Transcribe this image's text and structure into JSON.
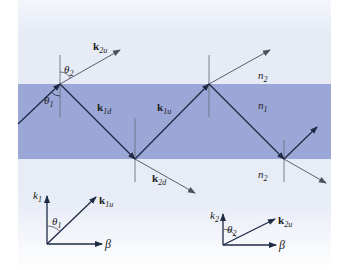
{
  "diagram": {
    "colors": {
      "cladding_top": "#e6ebf6",
      "cladding_bottom": "#ffffff",
      "core_band": "#9ba7d7",
      "ray": "#1f2a44",
      "transmitted_ray": "#4a4f5c",
      "normal_line": "#6e7280"
    },
    "regions": {
      "top_cladding_label": "n",
      "top_cladding_sub": "2",
      "core_label": "n",
      "core_sub": "1",
      "bottom_cladding_label": "n",
      "bottom_cladding_sub": "2"
    },
    "vectors": {
      "k2u": {
        "main": "k",
        "sub": "2u"
      },
      "k1d": {
        "main": "k",
        "sub": "1d"
      },
      "k1u": {
        "main": "k",
        "sub": "1u"
      },
      "k2d": {
        "main": "k",
        "sub": "2d"
      }
    },
    "angles": {
      "theta1": {
        "main": "θ",
        "sub": "1"
      },
      "theta2": {
        "main": "θ",
        "sub": "2"
      }
    },
    "inset_left": {
      "y_axis": {
        "main": "k",
        "sub": "1"
      },
      "x_axis": "β",
      "vector": {
        "main": "k",
        "sub": "1u"
      },
      "angle": {
        "main": "θ",
        "sub": "1"
      }
    },
    "inset_right": {
      "y_axis": {
        "main": "k",
        "sub": "2"
      },
      "x_axis": "β",
      "vector": {
        "main": "k",
        "sub": "2u"
      },
      "angle": {
        "main": "θ",
        "sub": "2"
      }
    }
  }
}
